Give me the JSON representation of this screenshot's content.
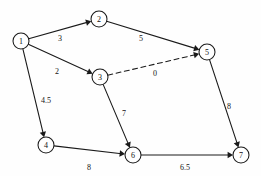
{
  "diagram": {
    "type": "directed-network-graph",
    "title": "",
    "canvas": {
      "width": 261,
      "height": 176,
      "background": "#fefefe"
    },
    "style": {
      "node_fill": "#ffffff",
      "node_stroke": "#1a1a1a",
      "edge_stroke": "#1a1a1a",
      "label_color": "#141414",
      "node_radius": 8
    },
    "nodes": [
      {
        "id": "1",
        "label": "1",
        "x": 21,
        "y": 41
      },
      {
        "id": "2",
        "label": "2",
        "x": 99,
        "y": 19
      },
      {
        "id": "3",
        "label": "3",
        "x": 100,
        "y": 77
      },
      {
        "id": "4",
        "label": "4",
        "x": 46,
        "y": 145
      },
      {
        "id": "5",
        "label": "5",
        "x": 207,
        "y": 52
      },
      {
        "id": "6",
        "label": "6",
        "x": 133,
        "y": 155
      },
      {
        "id": "7",
        "label": "7",
        "x": 241,
        "y": 155
      }
    ],
    "edges": [
      {
        "id": "e-1-2",
        "from": "1",
        "to": "2",
        "weight": "3",
        "style": "solid",
        "label_x": 60,
        "label_y": 38
      },
      {
        "id": "e-2-5",
        "from": "2",
        "to": "5",
        "weight": "5",
        "style": "solid",
        "label_x": 141,
        "label_y": 38
      },
      {
        "id": "e-1-3",
        "from": "1",
        "to": "3",
        "weight": "2",
        "style": "solid",
        "label_x": 57,
        "label_y": 71
      },
      {
        "id": "e-3-5",
        "from": "3",
        "to": "5",
        "weight": "0",
        "style": "dashed",
        "label_x": 155,
        "label_y": 73
      },
      {
        "id": "e-1-4",
        "from": "1",
        "to": "4",
        "weight": "4.5",
        "style": "solid",
        "label_x": 46,
        "label_y": 100
      },
      {
        "id": "e-3-6",
        "from": "3",
        "to": "6",
        "weight": "7",
        "style": "solid",
        "label_x": 124,
        "label_y": 113
      },
      {
        "id": "e-4-6",
        "from": "4",
        "to": "6",
        "weight": "8",
        "style": "solid",
        "label_x": 89,
        "label_y": 167
      },
      {
        "id": "e-5-7",
        "from": "5",
        "to": "7",
        "weight": "8",
        "style": "solid",
        "label_x": 229,
        "label_y": 106
      },
      {
        "id": "e-6-7",
        "from": "6",
        "to": "7",
        "weight": "6.5",
        "style": "solid",
        "label_x": 185,
        "label_y": 167
      }
    ]
  }
}
